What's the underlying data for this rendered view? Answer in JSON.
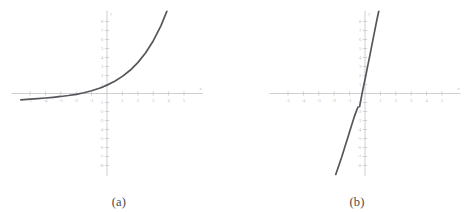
{
  "figure": {
    "background_color": "#ffffff",
    "axis_color": "#c3c3c7",
    "tick_label_color": "#b9b9bd",
    "curve_color": "#56565c",
    "caption_color": "#4a4a4a"
  },
  "panels": [
    {
      "caption": "(a)",
      "chart_data": {
        "type": "line",
        "title": "",
        "xlabel": "x",
        "ylabel": "y",
        "grid": false,
        "legend": "none",
        "xlim": [
          -6.2,
          6.2
        ],
        "ylim": [
          -9.2,
          9.2
        ],
        "xticks": [
          -5,
          -4,
          -3,
          -2,
          -1,
          1,
          2,
          3,
          4,
          5
        ],
        "xtick_labels": [
          "-5",
          "-4",
          "-3",
          "-2",
          "-1",
          "1",
          "2",
          "3",
          "4",
          "5"
        ],
        "yticks": [
          -8,
          -7,
          -6,
          -5,
          -4,
          -3,
          -2,
          -1,
          1,
          2,
          3,
          4,
          5,
          6,
          7,
          8
        ],
        "ytick_labels": [
          "-8",
          "-7",
          "-6",
          "-5",
          "-4",
          "-3",
          "-2",
          "-1",
          "1",
          "2",
          "3",
          "4",
          "5",
          "6",
          "7",
          "8"
        ],
        "series": [
          {
            "name": "exponential-curve",
            "x": [
              -5.6,
              -5.0,
              -4.5,
              -4.0,
              -3.5,
              -3.0,
              -2.5,
              -2.0,
              -1.5,
              -1.0,
              -0.5,
              -0.25,
              0.0,
              0.5,
              1.0,
              1.5,
              2.0,
              2.5,
              3.0,
              3.5,
              4.0,
              4.5,
              5.0,
              5.3
            ],
            "y": [
              -0.7,
              -0.63,
              -0.57,
              -0.5,
              -0.42,
              -0.33,
              -0.22,
              -0.09,
              0.08,
              0.3,
              0.58,
              0.74,
              0.93,
              1.36,
              1.9,
              2.58,
              3.43,
              4.5,
              5.84,
              7.52,
              9.62,
              12.25,
              15.55,
              18.0
            ]
          }
        ]
      }
    },
    {
      "caption": "(b)",
      "chart_data": {
        "type": "line",
        "title": "",
        "xlabel": "x",
        "ylabel": "y",
        "grid": false,
        "legend": "none",
        "xlim": [
          -6.2,
          6.2
        ],
        "ylim": [
          -9.2,
          9.2
        ],
        "xticks": [
          -5,
          -4,
          -3,
          -2,
          -1,
          1,
          2,
          3,
          4,
          5
        ],
        "xtick_labels": [
          "-5",
          "-4",
          "-3",
          "-2",
          "-1",
          "1",
          "2",
          "3",
          "4",
          "5"
        ],
        "yticks": [
          -8,
          -7,
          -6,
          -5,
          -4,
          -3,
          -2,
          -1,
          1,
          2,
          3,
          4,
          5,
          6,
          7,
          8
        ],
        "ytick_labels": [
          "-8",
          "-7",
          "-6",
          "-5",
          "-4",
          "-3",
          "-2",
          "-1",
          "1",
          "2",
          "3",
          "4",
          "5",
          "6",
          "7",
          "8"
        ],
        "series": [
          {
            "name": "steep-curve-upper",
            "x": [
              -0.35,
              -0.25,
              -0.15,
              0.0,
              0.15,
              0.3,
              0.45,
              0.6,
              0.75,
              0.9
            ],
            "y": [
              -1.45,
              -0.55,
              0.35,
              1.55,
              2.85,
              4.1,
              5.4,
              6.7,
              8.0,
              9.2
            ]
          },
          {
            "name": "steep-curve-lower",
            "x": [
              -1.9,
              -1.7,
              -1.5,
              -1.3,
              -1.1,
              -0.9,
              -0.7,
              -0.55,
              -0.45
            ],
            "y": [
              -9.0,
              -8.0,
              -7.0,
              -5.9,
              -4.8,
              -3.7,
              -2.6,
              -1.9,
              -1.5
            ]
          }
        ]
      }
    }
  ]
}
